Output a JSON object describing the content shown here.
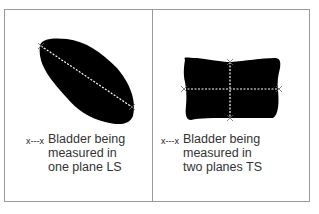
{
  "figure": {
    "panels": [
      {
        "id": "ls",
        "shape": "irregular oval bladder, single diagonal measurement line",
        "legend_key": "x---x",
        "legend_text": "Bladder being\nmeasured in\none plane LS"
      },
      {
        "id": "ts",
        "shape": "rounded rectangular bladder, cross-shaped measurement lines",
        "legend_key": "x---x",
        "legend_text": "Bladder being\nmeasured in\ntwo planes TS"
      }
    ],
    "colors": {
      "border": "#9a9a9a",
      "shape_fill": "#000000",
      "measure_line": "#ffffff",
      "text": "#333333"
    }
  }
}
